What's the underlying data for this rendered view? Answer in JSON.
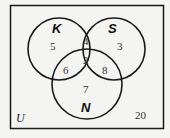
{
  "diagram": {
    "type": "venn",
    "universe_label": "U",
    "sets": [
      {
        "name": "K",
        "only": "5"
      },
      {
        "name": "S",
        "only": "3"
      },
      {
        "name": "N",
        "only": "7"
      }
    ],
    "regions": {
      "K_only": "5",
      "S_only": "3",
      "N_only": "7",
      "K_and_S_only": "4",
      "K_and_N_only": "6",
      "S_and_N_only": "8",
      "K_and_S_and_N": "2",
      "outside": "20"
    },
    "colors": {
      "stroke": "#1a1a1a",
      "background": "#f4f4f2"
    }
  }
}
